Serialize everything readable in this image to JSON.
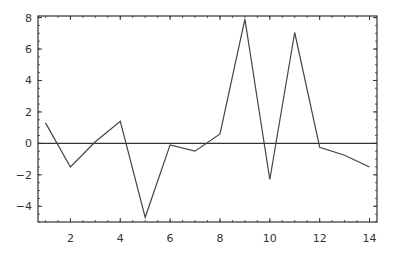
{
  "chart_data": {
    "type": "line",
    "title": "",
    "xlabel": "",
    "ylabel": "",
    "x": [
      1,
      2,
      3,
      4,
      5,
      6,
      7,
      8,
      9,
      10,
      11,
      12,
      13,
      14
    ],
    "series": [
      {
        "name": "series-1",
        "values": [
          1.3,
          -1.5,
          0.1,
          1.4,
          -4.7,
          -0.1,
          -0.5,
          0.6,
          7.9,
          -2.3,
          7.05,
          -0.25,
          -0.75,
          -1.5
        ]
      }
    ],
    "xlim": [
      0.7,
      14.3
    ],
    "ylim": [
      -5.0,
      8.1
    ],
    "xticks": [
      2,
      4,
      6,
      8,
      10,
      12,
      14
    ],
    "yticks": [
      -4,
      -2,
      0,
      2,
      4,
      6,
      8
    ],
    "reference_line_y": 0,
    "grid": false,
    "legend": null,
    "colors": {
      "line": "#444444",
      "frame": "#333333",
      "axis": "#333333"
    }
  }
}
